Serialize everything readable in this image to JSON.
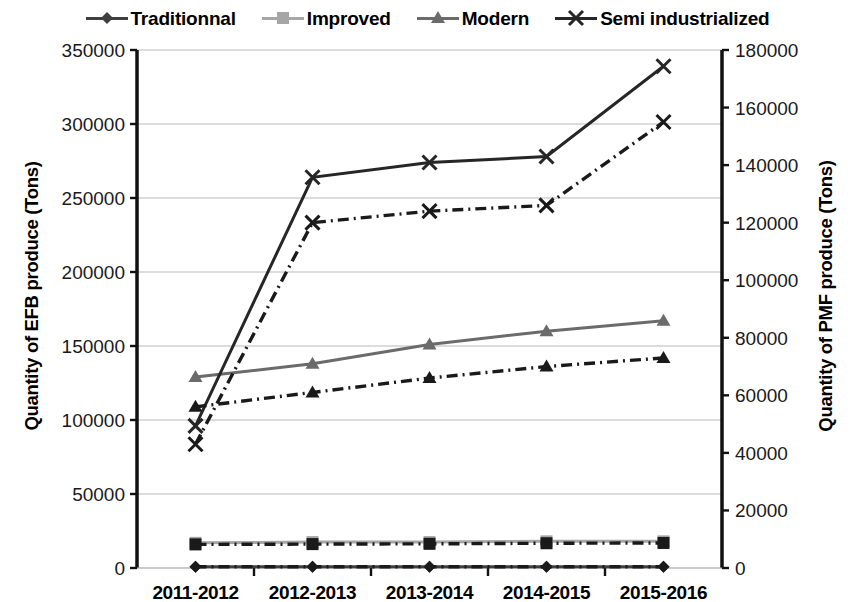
{
  "legend": {
    "items": [
      {
        "label": "Traditionnal",
        "marker": "diamond-marker",
        "color": "#3f3f3f"
      },
      {
        "label": "Improved",
        "marker": "square-marker",
        "color": "#a6a6a6"
      },
      {
        "label": "Modern",
        "marker": "triangle-marker",
        "color": "#6b6b6b"
      },
      {
        "label": "Semi industrialized",
        "marker": "x-marker",
        "color": "#262626"
      }
    ]
  },
  "axes": {
    "left_title": "Quantity of EFB produce (Tons)",
    "right_title": "Quantity of PMF produce (Tons)",
    "left_ticks": [
      "0",
      "50000",
      "100000",
      "150000",
      "200000",
      "250000",
      "300000",
      "350000"
    ],
    "right_ticks": [
      "0",
      "20000",
      "40000",
      "60000",
      "80000",
      "100000",
      "120000",
      "140000",
      "160000",
      "180000"
    ]
  },
  "chart_data": {
    "type": "line",
    "title": "",
    "xlabel": "",
    "ylabel": "Quantity of EFB produce (Tons)",
    "y2label": "Quantity of PMF produce (Tons)",
    "categories": [
      "2011-2012",
      "2012-2013",
      "2013-2014",
      "2014-2015",
      "2015-2016"
    ],
    "ylim": [
      0,
      350000
    ],
    "y2lim": [
      0,
      180000
    ],
    "ytick_step": 50000,
    "y2tick_step": 20000,
    "grid": true,
    "legend_position": "top",
    "series": [
      {
        "name": "Traditionnal",
        "axis": "left",
        "style": "solid",
        "marker": "diamond-marker",
        "color": "#3f3f3f",
        "values": [
          900,
          900,
          900,
          900,
          900
        ]
      },
      {
        "name": "Improved",
        "axis": "left",
        "style": "solid",
        "marker": "square-marker",
        "color": "#a6a6a6",
        "values": [
          17000,
          17500,
          17500,
          18000,
          18000
        ]
      },
      {
        "name": "Modern",
        "axis": "left",
        "style": "solid",
        "marker": "triangle-marker",
        "color": "#6b6b6b",
        "values": [
          129000,
          138000,
          151000,
          160000,
          167000
        ]
      },
      {
        "name": "Semi industrialized",
        "axis": "left",
        "style": "solid",
        "marker": "x-marker",
        "color": "#262626",
        "values": [
          96000,
          264000,
          274000,
          278000,
          339000
        ]
      },
      {
        "name": "Traditionnal",
        "axis": "right",
        "style": "dashdot",
        "marker": "diamond-marker",
        "color": "#1a1a1a",
        "values": [
          450,
          450,
          450,
          450,
          450
        ]
      },
      {
        "name": "Improved",
        "axis": "right",
        "style": "dashdot",
        "marker": "square-marker",
        "color": "#1a1a1a",
        "values": [
          8200,
          8300,
          8400,
          8600,
          8700
        ]
      },
      {
        "name": "Modern",
        "axis": "right",
        "style": "dashdot",
        "marker": "triangle-marker",
        "color": "#1a1a1a",
        "values": [
          56000,
          61000,
          66000,
          70000,
          73000
        ]
      },
      {
        "name": "Semi industrialized",
        "axis": "right",
        "style": "dashdot",
        "marker": "x-marker",
        "color": "#1a1a1a",
        "values": [
          43000,
          120000,
          124000,
          126000,
          155000
        ]
      }
    ]
  }
}
